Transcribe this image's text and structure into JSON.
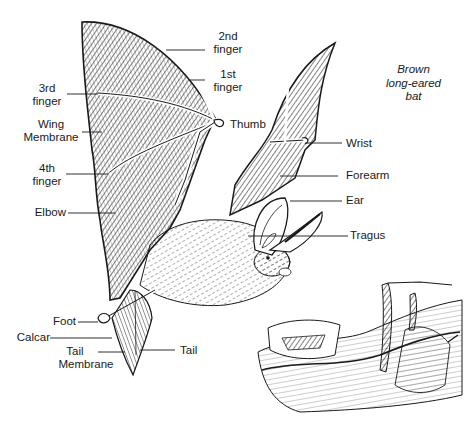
{
  "caption": {
    "lines": [
      "Brown",
      "long-eared",
      "bat"
    ]
  },
  "labels": {
    "second_finger": [
      "2nd",
      "finger"
    ],
    "first_finger": [
      "1st",
      "finger"
    ],
    "third_finger": [
      "3rd",
      "finger"
    ],
    "wing_membrane": [
      "Wing",
      "Membrane"
    ],
    "thumb": "Thumb",
    "wrist": "Wrist",
    "fourth_finger": [
      "4th",
      "finger"
    ],
    "forearm": "Forearm",
    "ear": "Ear",
    "elbow": "Elbow",
    "tragus": "Tragus",
    "foot": "Foot",
    "calcar": "Calcar",
    "tail_membrane": [
      "Tail",
      "Membrane"
    ],
    "tail": "Tail"
  },
  "colors": {
    "ink": "#1a1a1a",
    "paper": "#ffffff"
  }
}
